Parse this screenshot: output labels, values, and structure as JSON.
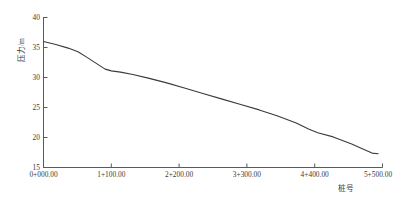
{
  "chart_data": {
    "type": "line",
    "title": "",
    "xlabel": "桩号",
    "ylabel": "压力/m",
    "xtick_labels": [
      "0+000.00",
      "1+100.00",
      "2+200.00",
      "3+300.00",
      "4+400.00",
      "5+500.00"
    ],
    "xtick_values": [
      0,
      1100,
      2200,
      3300,
      4400,
      5500
    ],
    "ytick_labels": [
      "15",
      "20",
      "25",
      "30",
      "35",
      "40"
    ],
    "ytick_values": [
      15,
      20,
      25,
      30,
      35,
      40
    ],
    "xlim": [
      0,
      5500
    ],
    "ylim": [
      15,
      40
    ],
    "grid": false,
    "legend": null,
    "line_color": "#3a3a3a",
    "axis_color": "#5a5a5a",
    "series": [
      {
        "name": "压力",
        "x": [
          0,
          200,
          400,
          560,
          700,
          850,
          1000,
          1100,
          1250,
          1450,
          1700,
          2000,
          2300,
          2600,
          2900,
          3200,
          3500,
          3800,
          4100,
          4300,
          4450,
          4700,
          5000,
          5200,
          5330,
          5430
        ],
        "y": [
          36.0,
          35.5,
          34.9,
          34.3,
          33.4,
          32.4,
          31.4,
          31.1,
          30.9,
          30.5,
          29.9,
          29.1,
          28.2,
          27.3,
          26.4,
          25.5,
          24.6,
          23.6,
          22.4,
          21.4,
          20.8,
          20.1,
          18.9,
          18.0,
          17.4,
          17.3
        ]
      }
    ]
  },
  "caption": {
    "text": ""
  }
}
